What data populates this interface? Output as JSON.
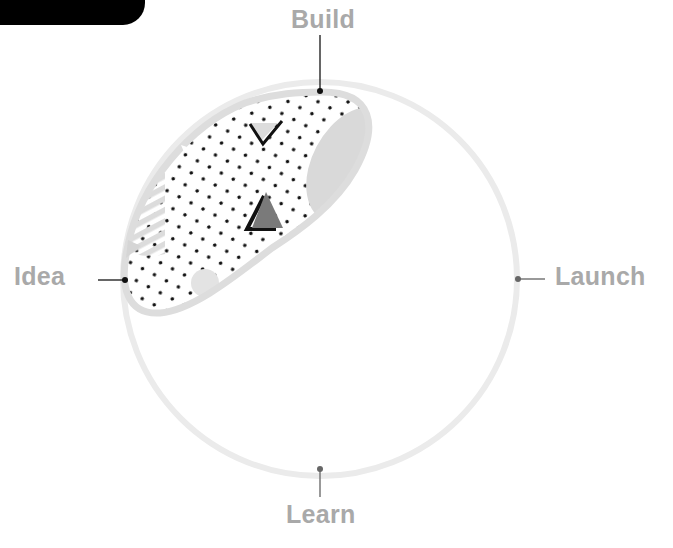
{
  "diagram": {
    "type": "cycle",
    "stages": {
      "build": {
        "label": "Build",
        "position": "top"
      },
      "launch": {
        "label": "Launch",
        "position": "right"
      },
      "learn": {
        "label": "Learn",
        "position": "bottom"
      },
      "idea": {
        "label": "Idea",
        "position": "left"
      }
    },
    "highlighted_segment": {
      "from": "Idea",
      "to": "Build",
      "style": "dotted-blob-with-shapes"
    },
    "colors": {
      "ring": "#ebebeb",
      "blob_outline": "#dddddd",
      "label": "#a9a9a9",
      "connector_dark": "#222222",
      "connector_light": "#777777",
      "shape_light": "#d9d9d9",
      "shape_dark_triangle": "#777777",
      "outline_black": "#111111"
    }
  }
}
